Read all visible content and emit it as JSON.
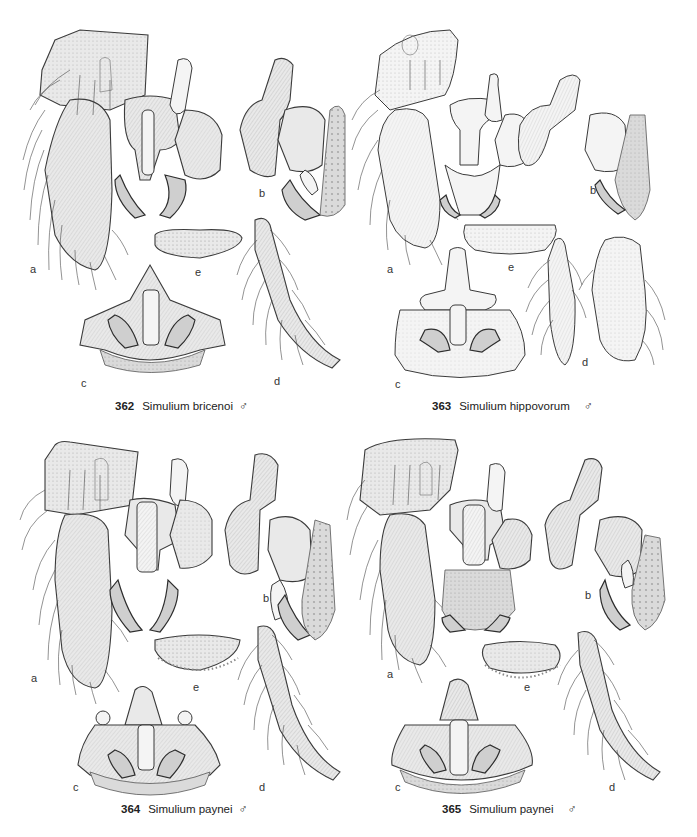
{
  "plates": [
    {
      "number": "362",
      "species": "Simulium bricenoi",
      "sex_symbol": "♂",
      "sublabels": {
        "a": "a",
        "b": "b",
        "c": "c",
        "d": "d",
        "e": "e"
      }
    },
    {
      "number": "363",
      "species": "Simulium hippovorum",
      "sex_symbol": "♂",
      "sublabels": {
        "a": "a",
        "b": "b",
        "c": "c",
        "d": "d",
        "e": "e"
      }
    },
    {
      "number": "364",
      "species": "Simulium paynei",
      "sex_symbol": "♂",
      "sublabels": {
        "a": "a",
        "b": "b",
        "c": "c",
        "d": "d",
        "e": "e"
      }
    },
    {
      "number": "365",
      "species": "Simulium paynei",
      "sex_symbol": "♂",
      "sublabels": {
        "a": "a",
        "b": "b",
        "c": "c",
        "d": "d",
        "e": "e"
      }
    }
  ]
}
